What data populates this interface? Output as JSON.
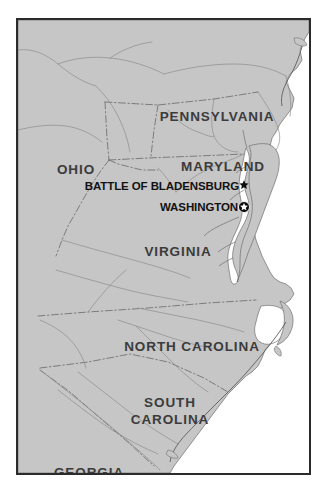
{
  "figure": {
    "kind": "reference-map",
    "region": "Mid-Atlantic and Southeastern United States",
    "frame_border_color": "#2b2b2b",
    "land_color": "#c6c6c6",
    "water_color": "#ffffff",
    "boundary_color": "#6e6e6e",
    "river_color": "#8d8d8d",
    "label_color": "#3b3b3b",
    "poi_color": "#121212"
  },
  "state_labels": [
    {
      "name": "PENNSYLVANIA",
      "x": 199,
      "y": 97,
      "size": "normal"
    },
    {
      "name": "OHIO",
      "x": 58,
      "y": 150,
      "size": "normal"
    },
    {
      "name": "MARYLAND",
      "x": 205,
      "y": 147,
      "size": "normal"
    },
    {
      "name": "VIRGINIA",
      "x": 160,
      "y": 232,
      "size": "normal"
    },
    {
      "name": "NORTH CAROLINA",
      "x": 174,
      "y": 327,
      "size": "normal"
    },
    {
      "name": "GEORGIA",
      "x": 71,
      "y": 453,
      "size": "normal"
    }
  ],
  "state_labels_multiline": [
    {
      "line1": "SOUTH",
      "line2": "CAROLINA",
      "x": 152,
      "y": 391
    }
  ],
  "points_of_interest": [
    {
      "label": "BATTLE OF BLADENSBURG",
      "label_x": 221,
      "label_y": 167,
      "marker": "solid-star",
      "marker_x": 226,
      "marker_y": 165,
      "marker_size": 11
    },
    {
      "label": "WASHINGTON",
      "label_x": 220,
      "label_y": 188,
      "marker": "circled-star-capital",
      "marker_x": 226,
      "marker_y": 187,
      "marker_size": 13
    }
  ]
}
